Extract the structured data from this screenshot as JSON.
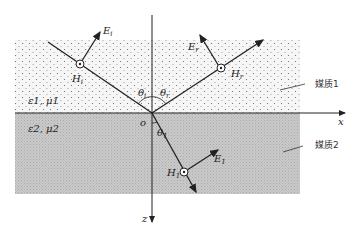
{
  "figure": {
    "type": "electromagnetic wave reflection/refraction at interface",
    "axes": {
      "x_label": "x",
      "z_label": "z",
      "origin_label": "o"
    },
    "medium1": {
      "label": "媒质1",
      "params": "ε1, μ1"
    },
    "medium2": {
      "label": "媒质2",
      "params": "ε2, μ2"
    },
    "incident": {
      "E": "E",
      "E_sub": "i",
      "H": "H",
      "H_sub": "i",
      "theta": "θ",
      "theta_sub": "i"
    },
    "reflected": {
      "E": "E",
      "E_sub": "r",
      "H": "H",
      "H_sub": "r",
      "theta": "θ",
      "theta_sub": "r"
    },
    "transmitted": {
      "E": "E",
      "E_sub": "1",
      "H": "H",
      "H_sub": "1",
      "theta": "θ",
      "theta_sub": "1"
    },
    "colors": {
      "medium1_bg": "#f4f4f4",
      "medium2_bg": "#c8c8c8",
      "line": "#222222"
    }
  }
}
